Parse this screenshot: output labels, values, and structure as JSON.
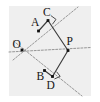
{
  "figure": {
    "canvas": {
      "width": 100,
      "height": 102
    },
    "plate": {
      "x": 9,
      "y": 6,
      "width": 82,
      "height": 90,
      "fill": "#efefef"
    },
    "colors": {
      "background": "#ffffff",
      "plate": "#efefef",
      "dashed_ray": "#8b8b8b",
      "solid_segment": "#3c3c3c",
      "point": "#111111",
      "label": "#151515"
    },
    "points": [
      {
        "id": "O",
        "label": "O",
        "x": 22.0,
        "y": 50.0,
        "label_x": 12.5,
        "label_y": 47.5,
        "dot": true
      },
      {
        "id": "A",
        "label": "A",
        "x": 38.5,
        "y": 31.0,
        "label_x": 31.0,
        "label_y": 25.5,
        "dot": true
      },
      {
        "id": "C",
        "label": "C",
        "x": 48.0,
        "y": 20.5,
        "label_x": 43.0,
        "label_y": 16.0,
        "dot": true
      },
      {
        "id": "P",
        "label": "P",
        "x": 68.0,
        "y": 50.5,
        "label_x": 66.5,
        "label_y": 44.5,
        "dot": true
      },
      {
        "id": "B",
        "label": "B",
        "x": 44.5,
        "y": 70.5,
        "label_x": 36.5,
        "label_y": 80.0,
        "dot": true
      },
      {
        "id": "D",
        "label": "D",
        "x": 52.5,
        "y": 76.5,
        "label_x": 46.5,
        "label_y": 89.0,
        "dot": true
      }
    ],
    "dashed_rays": [
      {
        "id": "ray-OC",
        "name": "ray-upper-through-A-C",
        "x1": 13.0,
        "y1": 60.0,
        "x2": 78.0,
        "y2": 7.0
      },
      {
        "id": "ray-OD",
        "name": "ray-lower-through-B-D",
        "x1": 13.5,
        "y1": 41.0,
        "x2": 82.0,
        "y2": 96.0
      },
      {
        "id": "ray-OP",
        "name": "ray-bisector-O-P",
        "x1": 9.0,
        "y1": 52.0,
        "x2": 91.0,
        "y2": 47.5
      }
    ],
    "solid_segments": [
      {
        "id": "seg-CP",
        "name": "segment-C-P",
        "x1": 48.0,
        "y1": 20.5,
        "x2": 68.0,
        "y2": 50.5
      },
      {
        "id": "seg-PD",
        "name": "segment-P-D",
        "x1": 68.0,
        "y1": 50.5,
        "x2": 52.5,
        "y2": 76.5
      },
      {
        "id": "seg-AC",
        "name": "segment-A-C",
        "x1": 38.5,
        "y1": 31.0,
        "x2": 48.0,
        "y2": 20.5
      },
      {
        "id": "seg-BD",
        "name": "segment-B-D",
        "x1": 44.5,
        "y1": 70.5,
        "x2": 52.5,
        "y2": 76.5
      }
    ],
    "right_angles": [
      {
        "id": "rt-C",
        "name": "right-angle-at-C",
        "points": "50.9,15.6 56.0,19.4 52.4,24.3"
      },
      {
        "id": "rt-D",
        "name": "right-angle-at-D",
        "points": "56.6,71.7 60.2,76.4 54.4,79.0"
      }
    ],
    "labels": {
      "O": "O",
      "A": "A",
      "C": "C",
      "P": "P",
      "B": "B",
      "D": "D"
    }
  }
}
